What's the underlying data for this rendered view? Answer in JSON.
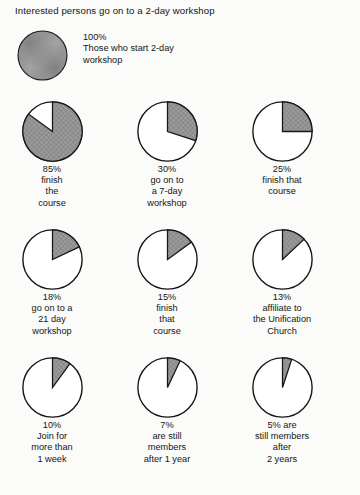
{
  "figure": {
    "title": "Interested persons go on to a 2-day workshop",
    "shade_color": "#9b9b9b",
    "outline_color": "#161616",
    "background_color": "#fbfbf9"
  },
  "top_unit": {
    "value": 100,
    "value_label": "100%",
    "caption": "100%\nThose who start 2-day\nworkshop",
    "caption_lines": [
      "100%",
      "Those who start 2-day",
      "workshop"
    ]
  },
  "cells": [
    {
      "value": 85,
      "value_label": "85%",
      "caption": "85%\nfinish\nthe\ncourse",
      "caption_lines": [
        "85%",
        "finish",
        "the",
        "course"
      ]
    },
    {
      "value": 30,
      "value_label": "30%",
      "caption": "30%\ngo on to\na 7-day\nworkshop",
      "caption_lines": [
        "30%",
        "go on to",
        "a 7-day",
        "workshop"
      ]
    },
    {
      "value": 25,
      "value_label": "25%",
      "caption": "25%\nfinish that\ncourse",
      "caption_lines": [
        "25%",
        "finish that",
        "course"
      ]
    },
    {
      "value": 18,
      "value_label": "18%",
      "caption": "18%\ngo on to a\n21 day\nworkshop",
      "caption_lines": [
        "18%",
        "go on to a",
        "21 day",
        "workshop"
      ]
    },
    {
      "value": 15,
      "value_label": "15%",
      "caption": "15%\nfinish\nthat\ncourse",
      "caption_lines": [
        "15%",
        "finish",
        "that",
        "course"
      ]
    },
    {
      "value": 13,
      "value_label": "13%",
      "caption": "13%\naffiliate to\nthe Unification\nChurch",
      "caption_lines": [
        "13%",
        "affiliate to",
        "the Unification",
        "Church"
      ]
    },
    {
      "value": 10,
      "value_label": "10%",
      "caption": "10%\nJoin for\nmore than\n1 week",
      "caption_lines": [
        "10%",
        "Join for",
        "more than",
        "1 week"
      ]
    },
    {
      "value": 7,
      "value_label": "7%",
      "caption": "7%\nare still\nmembers\nafter 1 year",
      "caption_lines": [
        "7%",
        "are still",
        "members",
        "after 1 year"
      ]
    },
    {
      "value": 5,
      "value_label": "5% are",
      "caption": "5% are\nstill members\nafter\n2 years",
      "caption_lines": [
        "5% are",
        "still members",
        "after",
        "2 years"
      ]
    }
  ],
  "chart_data": {
    "type": "pie",
    "title": "Interested persons go on to a 2-day workshop",
    "subtitle": "",
    "xlabel": "",
    "ylabel": "",
    "units": "percent",
    "note": "Series of ten pie charts; each pie shows the shaded fraction of the original 100% cohort remaining at that stage. Shaded wedge starts at 12 o'clock and sweeps clockwise.",
    "categories": [
      "Those who start 2-day workshop",
      "finish the course",
      "go on to a 7-day workshop",
      "finish that course",
      "go on to a 21 day workshop",
      "finish that course",
      "affiliate to the Unification Church",
      "Join for more than 1 week",
      "are still members after 1 year",
      "still members after 2 years"
    ],
    "values": [
      100,
      85,
      30,
      25,
      18,
      15,
      13,
      10,
      7,
      5
    ],
    "labels": [
      "100%",
      "85%",
      "30%",
      "25%",
      "18%",
      "15%",
      "13%",
      "10%",
      "7%",
      "5%"
    ],
    "ylim": [
      0,
      100
    ],
    "grid": false,
    "legend": "none"
  }
}
